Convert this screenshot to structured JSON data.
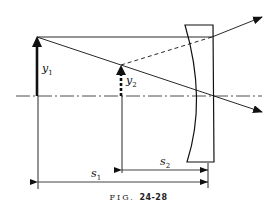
{
  "figure": {
    "caption_prefix": "FIG.",
    "caption_number": "24-28"
  },
  "labels": {
    "y1": {
      "base": "y",
      "sub": "1"
    },
    "y2": {
      "base": "y",
      "sub": "2"
    },
    "s1": {
      "base": "s",
      "sub": "1"
    },
    "s2": {
      "base": "s",
      "sub": "2"
    }
  },
  "elements": {
    "optical_axis": "dash-dot horizontal line",
    "object_arrow": "solid arrow y1",
    "image_arrow": "dashed arrow y2 (virtual image)",
    "lens": "plano-concave lens",
    "rays": [
      "parallel ray refracted upward",
      "chief ray through center",
      "dashed virtual extension"
    ],
    "dimensions": [
      "s1 object distance",
      "s2 image distance"
    ]
  }
}
